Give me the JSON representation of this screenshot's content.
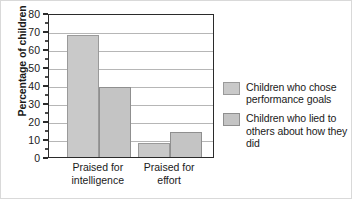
{
  "chart_data": {
    "type": "bar",
    "title": "",
    "subtitle": "",
    "xlabel": "",
    "ylabel": "Percentage of children",
    "ylim": [
      0,
      80
    ],
    "ytick_values": [
      0,
      10,
      20,
      30,
      40,
      50,
      60,
      70,
      80
    ],
    "ytick_labels": [
      "0",
      "10",
      "20",
      "30",
      "40",
      "50",
      "60",
      "70",
      "80"
    ],
    "minor_ticks": true,
    "grid": "horizontal",
    "legend_position": "right",
    "categories": [
      "Praised for intelligence",
      "Praised for effort"
    ],
    "category_labels": [
      {
        "line1": "Praised for",
        "line2": "intelligence"
      },
      {
        "line1": "Praised for",
        "line2": "effort"
      }
    ],
    "series": [
      {
        "name": "Children who chose performance goals",
        "color": "#c9c9c9",
        "border": "#9a9a9a",
        "values": [
          68,
          8
        ]
      },
      {
        "name": "Children who lied to others about how they did",
        "color": "#c4c4c4",
        "border": "#8f8f8f",
        "values": [
          39,
          14
        ]
      }
    ]
  },
  "legend": {
    "entries": [
      {
        "label": "Children who chose performance goals"
      },
      {
        "label": "Children who lied to others about how they did"
      }
    ]
  },
  "axis": {
    "y_title": "Percentage of children"
  }
}
